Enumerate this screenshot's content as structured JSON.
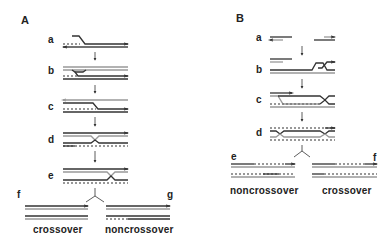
{
  "panels": [
    {
      "id": "A",
      "label": "A",
      "steps": [
        "a",
        "b",
        "c",
        "d",
        "e"
      ],
      "products": [
        {
          "letter": "f",
          "outcome": "crossover"
        },
        {
          "letter": "g",
          "outcome": "noncrossover"
        }
      ]
    },
    {
      "id": "B",
      "label": "B",
      "steps": [
        "a",
        "b",
        "c",
        "d"
      ],
      "products": [
        {
          "letter": "e",
          "outcome": "noncrossover"
        },
        {
          "letter": "f",
          "outcome": "crossover"
        }
      ]
    }
  ],
  "colors": {
    "strand_dark": "#333333",
    "strand_light": "#9a9a9a",
    "background": "#ffffff"
  }
}
